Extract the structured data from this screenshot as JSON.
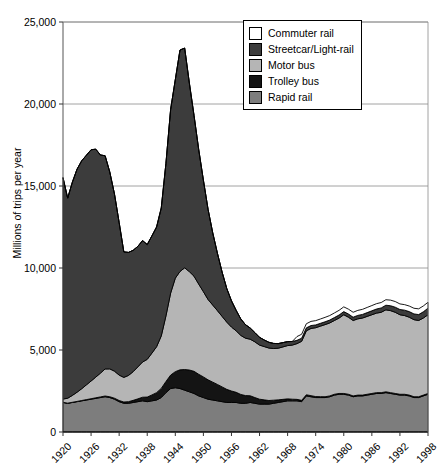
{
  "chart_data": {
    "type": "area",
    "stacked": true,
    "title": "",
    "xlabel": "",
    "ylabel": "Millions of trips per year",
    "ylim": [
      0,
      25000
    ],
    "yticks": [
      "0",
      "5,000",
      "10,000",
      "15,000",
      "20,000",
      "25,000"
    ],
    "ytick_values": [
      0,
      5000,
      10000,
      15000,
      20000,
      25000
    ],
    "grid": true,
    "legend_position": "top-right",
    "xlim": [
      1920,
      1998
    ],
    "xticks": [
      "1920",
      "1926",
      "1932",
      "1938",
      "1944",
      "1950",
      "1956",
      "1962",
      "1968",
      "1974",
      "1980",
      "1986",
      "1992",
      "1998"
    ],
    "xtick_values": [
      1920,
      1926,
      1932,
      1938,
      1944,
      1950,
      1956,
      1962,
      1968,
      1974,
      1980,
      1986,
      1992,
      1998
    ],
    "x": [
      1920,
      1921,
      1922,
      1923,
      1924,
      1925,
      1926,
      1927,
      1928,
      1929,
      1930,
      1931,
      1932,
      1933,
      1934,
      1935,
      1936,
      1937,
      1938,
      1939,
      1940,
      1941,
      1942,
      1943,
      1944,
      1945,
      1946,
      1947,
      1948,
      1949,
      1950,
      1951,
      1952,
      1953,
      1954,
      1955,
      1956,
      1957,
      1958,
      1959,
      1960,
      1961,
      1962,
      1963,
      1964,
      1965,
      1966,
      1967,
      1968,
      1969,
      1970,
      1971,
      1972,
      1973,
      1974,
      1975,
      1976,
      1977,
      1978,
      1979,
      1980,
      1981,
      1982,
      1983,
      1984,
      1985,
      1986,
      1987,
      1988,
      1989,
      1990,
      1991,
      1992,
      1993,
      1994,
      1995,
      1996,
      1997,
      1998
    ],
    "series": [
      {
        "name": "Rapid rail",
        "color": "#7d7d7d",
        "values": [
          1800,
          1750,
          1800,
          1850,
          1900,
          1950,
          2000,
          2050,
          2100,
          2150,
          2100,
          2000,
          1850,
          1750,
          1750,
          1800,
          1850,
          1900,
          1850,
          1900,
          1950,
          2100,
          2400,
          2650,
          2700,
          2650,
          2550,
          2450,
          2350,
          2200,
          2100,
          2000,
          1950,
          1900,
          1850,
          1800,
          1800,
          1800,
          1750,
          1750,
          1800,
          1750,
          1700,
          1700,
          1700,
          1750,
          1800,
          1850,
          1900,
          1900,
          1900,
          1850,
          2200,
          2150,
          2100,
          2100,
          2100,
          2150,
          2250,
          2300,
          2300,
          2250,
          2150,
          2200,
          2200,
          2250,
          2300,
          2350,
          2350,
          2400,
          2350,
          2300,
          2250,
          2250,
          2200,
          2100,
          2100,
          2200,
          2300
        ]
      },
      {
        "name": "Trolley bus",
        "color": "#141414",
        "values": [
          10,
          10,
          12,
          15,
          20,
          25,
          30,
          35,
          40,
          45,
          50,
          60,
          70,
          80,
          100,
          130,
          170,
          220,
          280,
          360,
          450,
          560,
          680,
          820,
          980,
          1140,
          1260,
          1330,
          1350,
          1320,
          1260,
          1180,
          1090,
          1000,
          900,
          800,
          700,
          620,
          540,
          470,
          410,
          350,
          300,
          260,
          220,
          190,
          160,
          140,
          120,
          100,
          90,
          80,
          70,
          65,
          60,
          55,
          50,
          50,
          50,
          50,
          50,
          50,
          50,
          50,
          50,
          50,
          50,
          50,
          50,
          50,
          50,
          50,
          50,
          50,
          50,
          50,
          50,
          50,
          50
        ]
      },
      {
        "name": "Motor bus",
        "color": "#b5b5b5",
        "values": [
          200,
          300,
          420,
          560,
          720,
          900,
          1080,
          1260,
          1450,
          1650,
          1700,
          1650,
          1550,
          1500,
          1600,
          1750,
          1950,
          2150,
          2300,
          2550,
          2800,
          3200,
          4000,
          5000,
          5700,
          6000,
          6200,
          6000,
          5800,
          5500,
          5200,
          4900,
          4700,
          4500,
          4300,
          4100,
          3900,
          3750,
          3600,
          3500,
          3450,
          3400,
          3300,
          3250,
          3200,
          3150,
          3150,
          3200,
          3250,
          3300,
          3400,
          3600,
          3900,
          4100,
          4200,
          4300,
          4400,
          4450,
          4500,
          4600,
          4800,
          4700,
          4600,
          4650,
          4700,
          4750,
          4800,
          4850,
          4900,
          5000,
          5000,
          4950,
          4850,
          4800,
          4750,
          4700,
          4650,
          4700,
          4800
        ]
      },
      {
        "name": "Streetcar/Light-rail",
        "color": "#3c3c3c",
        "values": [
          13500,
          12200,
          13000,
          13600,
          13900,
          14000,
          14100,
          13900,
          13300,
          13000,
          12000,
          10800,
          9300,
          7650,
          7500,
          7400,
          7350,
          7400,
          7000,
          7150,
          7300,
          7800,
          9300,
          11200,
          12100,
          13500,
          13400,
          11500,
          9800,
          8200,
          6800,
          5500,
          4400,
          3500,
          2700,
          2050,
          1600,
          1250,
          1000,
          820,
          680,
          560,
          470,
          400,
          350,
          310,
          280,
          260,
          240,
          220,
          200,
          190,
          180,
          175,
          170,
          170,
          170,
          175,
          180,
          185,
          190,
          195,
          200,
          210,
          220,
          230,
          240,
          250,
          265,
          280,
          300,
          310,
          320,
          330,
          340,
          350,
          360,
          380,
          400
        ]
      },
      {
        "name": "Commuter rail",
        "color": "#ffffff",
        "values": [
          0,
          0,
          0,
          0,
          0,
          0,
          0,
          0,
          0,
          0,
          0,
          0,
          0,
          0,
          0,
          0,
          0,
          0,
          0,
          0,
          0,
          0,
          0,
          0,
          0,
          0,
          0,
          0,
          0,
          0,
          0,
          0,
          0,
          0,
          0,
          0,
          0,
          0,
          0,
          0,
          0,
          0,
          0,
          0,
          0,
          0,
          0,
          0,
          0,
          0,
          230,
          240,
          250,
          255,
          260,
          265,
          270,
          275,
          280,
          285,
          290,
          295,
          300,
          305,
          310,
          315,
          320,
          325,
          330,
          335,
          340,
          345,
          340,
          335,
          340,
          345,
          350,
          355,
          360
        ]
      }
    ]
  },
  "legend": {
    "items": [
      {
        "label": "Commuter rail",
        "color": "#ffffff"
      },
      {
        "label": "Streetcar/Light-rail",
        "color": "#3c3c3c"
      },
      {
        "label": "Motor bus",
        "color": "#b5b5b5"
      },
      {
        "label": "Trolley bus",
        "color": "#141414"
      },
      {
        "label": "Rapid rail",
        "color": "#7d7d7d"
      }
    ]
  },
  "axes": {
    "y_title": "Millions of trips per year"
  }
}
